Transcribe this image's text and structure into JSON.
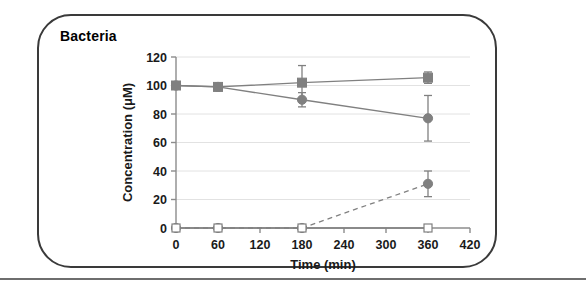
{
  "panel": {
    "title": "Bacteria"
  },
  "chart_data": {
    "type": "line",
    "title": "Bacteria",
    "xlabel": "Time (min)",
    "ylabel": "Concentration (μM)",
    "xlim": [
      0,
      420
    ],
    "ylim": [
      0,
      120
    ],
    "xticks": [
      0,
      60,
      120,
      180,
      240,
      300,
      360,
      420
    ],
    "xtick_labels": [
      "0",
      "60",
      "120",
      "180",
      "240",
      "300",
      "360",
      "420"
    ],
    "yticks": [
      0,
      20,
      40,
      60,
      80,
      100,
      120
    ],
    "ytick_labels": [
      "0",
      "20",
      "40",
      "60",
      "80",
      "100",
      "120"
    ],
    "grid": "horizontal-light",
    "legend": "none",
    "x": [
      0,
      60,
      180,
      360
    ],
    "series": [
      {
        "name": "series-squares-filled",
        "marker": "filled-square",
        "linestyle": "solid",
        "color": "#808080",
        "values": [
          100,
          99,
          102,
          105.5
        ],
        "errors": [
          0,
          1.5,
          12,
          4
        ]
      },
      {
        "name": "series-circles-filled",
        "marker": "filled-circle",
        "linestyle": "solid",
        "color": "#808080",
        "values": [
          100,
          99,
          90,
          77
        ],
        "errors": [
          0,
          1.5,
          5,
          16
        ]
      },
      {
        "name": "series-circles-dashed",
        "marker": "filled-circle",
        "linestyle": "dashed",
        "color": "#808080",
        "values": [
          0,
          0,
          0,
          31
        ],
        "errors": [
          0,
          0,
          0,
          9
        ]
      },
      {
        "name": "series-squares-open",
        "marker": "open-square",
        "linestyle": "solid",
        "color": "#808080",
        "values": [
          0,
          0,
          0,
          0
        ],
        "errors": [
          0,
          0,
          0,
          0
        ]
      }
    ]
  },
  "colors": {
    "series": "#808080",
    "frame": "#3a3a3a",
    "axis": "#8c8c8c",
    "grid": "#e2e2e2",
    "text": "#1a1a1a"
  }
}
